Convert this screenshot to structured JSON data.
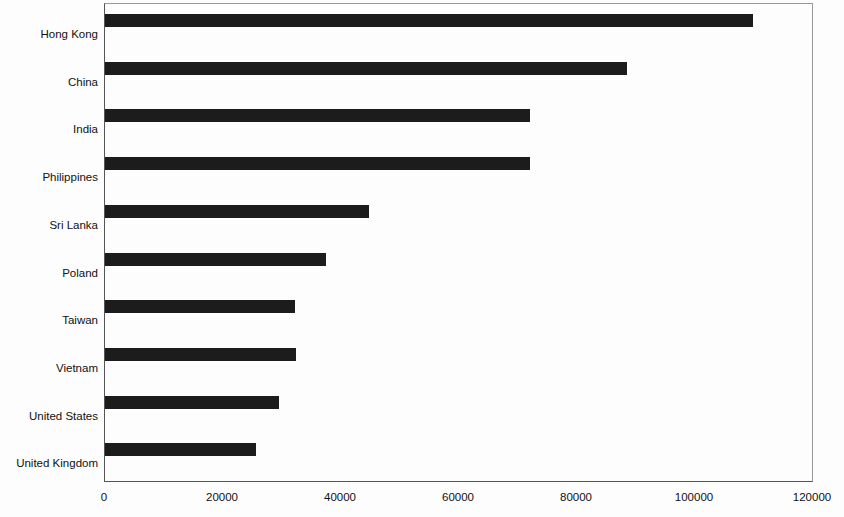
{
  "chart_data": {
    "type": "bar",
    "orientation": "horizontal",
    "title": "",
    "subtitle": "",
    "xlabel": "",
    "ylabel": "",
    "xlim": [
      0,
      120000
    ],
    "grid": false,
    "legend": false,
    "bar_color": "#1c1c1c",
    "categories": [
      "Hong Kong",
      "China",
      "India",
      "Philippines",
      "Sri Lanka",
      "Poland",
      "Taiwan",
      "Vietnam",
      "United States",
      "United Kingdom"
    ],
    "values": [
      109900,
      88400,
      72100,
      72000,
      44700,
      37400,
      32200,
      32400,
      29500,
      25600
    ],
    "xticks": [
      0,
      20000,
      40000,
      60000,
      80000,
      100000,
      120000
    ],
    "xticklabels": [
      "0",
      "20000",
      "40000",
      "60000",
      "80000",
      "100000",
      "120000"
    ]
  }
}
